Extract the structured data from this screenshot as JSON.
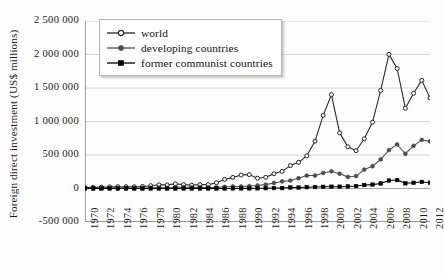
{
  "chart_data": {
    "type": "line",
    "title": "",
    "xlabel": "",
    "ylabel": "Foreign direct investment (US$ millions)",
    "xlim": [
      1970,
      2012
    ],
    "ylim": [
      -500000,
      2500000
    ],
    "grid": true,
    "legend_position": "top-left",
    "y_ticks": [
      2500000,
      2000000,
      1500000,
      1000000,
      500000,
      0,
      -500000
    ],
    "y_tick_labels": [
      "2 500 000",
      "2 000 000",
      "1 500 000",
      "1 000 000",
      "500 000",
      "0",
      "-500 000"
    ],
    "x_ticks": [
      1970,
      1972,
      1974,
      1976,
      1978,
      1980,
      1982,
      1984,
      1986,
      1988,
      1990,
      1992,
      1994,
      1996,
      1998,
      2000,
      2002,
      2004,
      2006,
      2008,
      2010,
      2012
    ],
    "x_tick_labels": [
      "1970",
      "1972",
      "1974",
      "1976",
      "1978",
      "1980",
      "1982",
      "1984",
      "1986",
      "1988",
      "1990",
      "1992",
      "1994",
      "1996",
      "1998",
      "2000",
      "2002",
      "2004",
      "2006",
      "2008",
      "2010",
      "2012"
    ],
    "x": [
      1970,
      1971,
      1972,
      1973,
      1974,
      1975,
      1976,
      1977,
      1978,
      1979,
      1980,
      1981,
      1982,
      1983,
      1984,
      1985,
      1986,
      1987,
      1988,
      1989,
      1990,
      1991,
      1992,
      1993,
      1994,
      1995,
      1996,
      1997,
      1998,
      1999,
      2000,
      2001,
      2002,
      2003,
      2004,
      2005,
      2006,
      2007,
      2008,
      2009,
      2010,
      2011,
      2012
    ],
    "series": [
      {
        "name": "world",
        "marker": "open-circle",
        "color": "#222222",
        "values": [
          13400,
          16500,
          19000,
          24000,
          27000,
          27500,
          26000,
          30000,
          42000,
          55000,
          54000,
          70000,
          58000,
          50000,
          58000,
          57000,
          86000,
          136000,
          166000,
          201000,
          207000,
          154000,
          167000,
          220000,
          256000,
          342000,
          391000,
          488000,
          706000,
          1092000,
          1400000,
          830000,
          622000,
          564000,
          742000,
          989000,
          1463000,
          2002000,
          1791000,
          1198000,
          1422000,
          1614000,
          1351000
        ]
      },
      {
        "name": "developing countries",
        "marker": "filled-circle",
        "color": "#4d4d4d",
        "values": [
          3800,
          4500,
          5200,
          6500,
          7000,
          8500,
          7000,
          8000,
          11000,
          13000,
          8000,
          19000,
          20000,
          16000,
          17000,
          15000,
          16000,
          25000,
          30000,
          30000,
          36000,
          45000,
          58000,
          82000,
          106000,
          119000,
          154000,
          193000,
          194000,
          232000,
          257000,
          221000,
          173000,
          186000,
          283000,
          332000,
          434000,
          574000,
          658000,
          519000,
          637000,
          725000,
          703000
        ]
      },
      {
        "name": "former communist countries",
        "marker": "filled-square",
        "color": "#000000",
        "values": [
          0,
          0,
          0,
          0,
          0,
          0,
          0,
          0,
          0,
          0,
          0,
          0,
          0,
          0,
          0,
          0,
          0,
          0,
          1000,
          2000,
          2000,
          3000,
          5000,
          7000,
          6000,
          15000,
          14000,
          20000,
          22000,
          25000,
          27000,
          27000,
          31000,
          36000,
          52000,
          58000,
          75000,
          118000,
          126000,
          78000,
          85000,
          98000,
          87000
        ]
      }
    ]
  }
}
